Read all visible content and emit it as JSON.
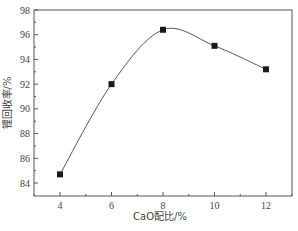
{
  "chart_data": {
    "type": "line",
    "title": "",
    "xlabel": "CaO配比/%",
    "ylabel": "锂回收率/%",
    "x": [
      4,
      6,
      8,
      10,
      12
    ],
    "series": [
      {
        "name": "锂回收率",
        "values": [
          84.7,
          92.0,
          96.4,
          95.1,
          93.2
        ],
        "marker": "square",
        "smooth": true
      }
    ],
    "xticks": [
      "4",
      "6",
      "8",
      "10",
      "12"
    ],
    "yticks": [
      "84",
      "86",
      "88",
      "90",
      "92",
      "94",
      "96",
      "98"
    ],
    "xlim": [
      3,
      13.2
    ],
    "ylim": [
      83,
      98
    ],
    "grid": false,
    "legend": null
  },
  "colors": {
    "line": "#555555",
    "marker": "#1a1a1a",
    "axis": "#555555"
  }
}
